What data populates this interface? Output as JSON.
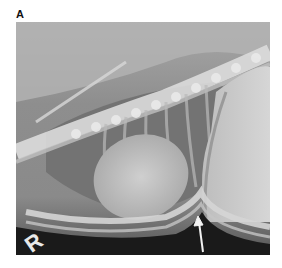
{
  "figure": {
    "panel_label": "A",
    "image_description": "Lateral thoracic radiograph",
    "side_marker": "R",
    "annotation": "arrow"
  },
  "colors": {
    "background": "#ffffff",
    "film_dark": "#1a1a1a",
    "soft_tissue": "#9a9a9a",
    "bone": "#e6e6e6"
  }
}
